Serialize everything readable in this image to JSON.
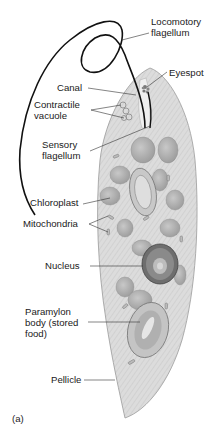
{
  "figure": {
    "panel_label": "(a)",
    "labels": [
      {
        "id": "locomotory-flagellum",
        "text": "Locomotory\nflagellum",
        "x": 151,
        "y": 16
      },
      {
        "id": "eyespot",
        "text": "Eyespot",
        "x": 169,
        "y": 67
      },
      {
        "id": "canal",
        "text": "Canal",
        "x": 57,
        "y": 82
      },
      {
        "id": "contractile-vacuole",
        "text": "Contractile\nvacuole",
        "x": 34,
        "y": 99
      },
      {
        "id": "sensory-flagellum",
        "text": "Sensory\nflagellum",
        "x": 42,
        "y": 139
      },
      {
        "id": "chloroplast",
        "text": "Chloroplast",
        "x": 30,
        "y": 197
      },
      {
        "id": "mitochondria",
        "text": "Mitochondria",
        "x": 23,
        "y": 218
      },
      {
        "id": "nucleus",
        "text": "Nucleus",
        "x": 45,
        "y": 260
      },
      {
        "id": "paramylon-body",
        "text": "Paramylon\nbody (stored\nfood)",
        "x": 25,
        "y": 306
      },
      {
        "id": "pellicle",
        "text": "Pellicle",
        "x": 51,
        "y": 374
      }
    ],
    "colors": {
      "cell_body": "#d9d9d9",
      "cell_stroke": "#9a9a9a",
      "organelle": "#b8b8b8",
      "organelle_dark": "#7a7a7a",
      "flagellum": "#111111",
      "leader": "#333333"
    }
  }
}
